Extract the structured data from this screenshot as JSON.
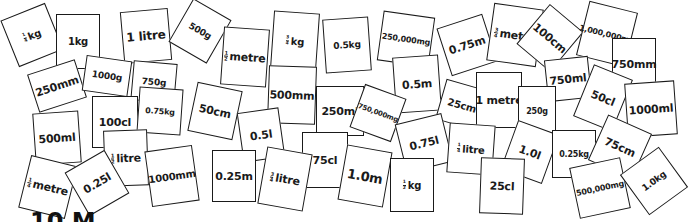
{
  "colors": {
    "card_border": "#1a1a1a",
    "card_fill": "#ffffff",
    "text": "#1a1a1a",
    "background": "#ffffff"
  },
  "cards": [
    {
      "label": "kg",
      "frac": [
        "1",
        "4"
      ],
      "x": 8,
      "y": 10,
      "w": 48,
      "h": 50,
      "rot": -22,
      "fs": 10
    },
    {
      "label": "1kg",
      "frac": null,
      "x": 56,
      "y": 14,
      "w": 44,
      "h": 55,
      "rot": 0,
      "fs": 10
    },
    {
      "label": "1 litre",
      "frac": null,
      "x": 122,
      "y": 10,
      "w": 48,
      "h": 52,
      "rot": -5,
      "fs": 12
    },
    {
      "label": "250mm",
      "frac": null,
      "x": 32,
      "y": 66,
      "w": 50,
      "h": 40,
      "rot": -18,
      "fs": 11
    },
    {
      "label": "1000g",
      "frac": null,
      "x": 84,
      "y": 58,
      "w": 46,
      "h": 36,
      "rot": 8,
      "fs": 9
    },
    {
      "label": "500g",
      "frac": null,
      "x": 178,
      "y": 6,
      "w": 44,
      "h": 50,
      "rot": 30,
      "fs": 9
    },
    {
      "label": "750g",
      "frac": null,
      "x": 132,
      "y": 62,
      "w": 44,
      "h": 40,
      "rot": 5,
      "fs": 9
    },
    {
      "label": "metre",
      "frac": [
        "1",
        "2"
      ],
      "x": 222,
      "y": 28,
      "w": 46,
      "h": 58,
      "rot": 4,
      "fs": 11
    },
    {
      "label": "kg",
      "frac": [
        "3",
        "4"
      ],
      "x": 272,
      "y": 12,
      "w": 46,
      "h": 58,
      "rot": 4,
      "fs": 10
    },
    {
      "label": "500mm",
      "frac": null,
      "x": 268,
      "y": 66,
      "w": 48,
      "h": 58,
      "rot": 2,
      "fs": 11
    },
    {
      "label": "0.5kg",
      "frac": null,
      "x": 324,
      "y": 18,
      "w": 46,
      "h": 54,
      "rot": -4,
      "fs": 9
    },
    {
      "label": "250,000mg",
      "frac": null,
      "x": 380,
      "y": 14,
      "w": 52,
      "h": 50,
      "rot": 8,
      "fs": 8
    },
    {
      "label": "0.5m",
      "frac": null,
      "x": 394,
      "y": 56,
      "w": 46,
      "h": 56,
      "rot": -4,
      "fs": 11
    },
    {
      "label": "0.75m",
      "frac": null,
      "x": 443,
      "y": 20,
      "w": 48,
      "h": 50,
      "rot": -18,
      "fs": 11
    },
    {
      "label": "metre",
      "frac": [
        "3",
        "4"
      ],
      "x": 490,
      "y": 6,
      "w": 50,
      "h": 58,
      "rot": 8,
      "fs": 11
    },
    {
      "label": "100cm",
      "frac": null,
      "x": 528,
      "y": 12,
      "w": 44,
      "h": 52,
      "rot": 40,
      "fs": 11
    },
    {
      "label": "1,000,000mg",
      "frac": null,
      "x": 582,
      "y": 6,
      "w": 50,
      "h": 56,
      "rot": 14,
      "fs": 8
    },
    {
      "label": "750mm",
      "frac": null,
      "x": 612,
      "y": 38,
      "w": 44,
      "h": 52,
      "rot": 0,
      "fs": 11
    },
    {
      "label": "750ml",
      "frac": null,
      "x": 546,
      "y": 58,
      "w": 44,
      "h": 42,
      "rot": -6,
      "fs": 11
    },
    {
      "label": "25cm",
      "frac": null,
      "x": 440,
      "y": 84,
      "w": 44,
      "h": 42,
      "rot": 16,
      "fs": 10
    },
    {
      "label": "1 metre",
      "frac": null,
      "x": 476,
      "y": 72,
      "w": 46,
      "h": 56,
      "rot": 0,
      "fs": 11
    },
    {
      "label": "250g",
      "frac": null,
      "x": 518,
      "y": 86,
      "w": 38,
      "h": 50,
      "rot": 0,
      "fs": 8
    },
    {
      "label": "50cl",
      "frac": null,
      "x": 582,
      "y": 70,
      "w": 42,
      "h": 56,
      "rot": 22,
      "fs": 11
    },
    {
      "label": "1000ml",
      "frac": null,
      "x": 626,
      "y": 82,
      "w": 50,
      "h": 54,
      "rot": -4,
      "fs": 11
    },
    {
      "label": "250ml",
      "frac": null,
      "x": 316,
      "y": 86,
      "w": 48,
      "h": 50,
      "rot": 0,
      "fs": 11
    },
    {
      "label": "750,000mg",
      "frac": null,
      "x": 356,
      "y": 90,
      "w": 44,
      "h": 46,
      "rot": 20,
      "fs": 7
    },
    {
      "label": "100cl",
      "frac": null,
      "x": 92,
      "y": 96,
      "w": 46,
      "h": 52,
      "rot": 0,
      "fs": 11
    },
    {
      "label": "0.75kg",
      "frac": null,
      "x": 138,
      "y": 88,
      "w": 44,
      "h": 46,
      "rot": 4,
      "fs": 8
    },
    {
      "label": "50cm",
      "frac": null,
      "x": 192,
      "y": 86,
      "w": 46,
      "h": 50,
      "rot": 12,
      "fs": 11
    },
    {
      "label": "0.5l",
      "frac": null,
      "x": 240,
      "y": 110,
      "w": 42,
      "h": 50,
      "rot": -8,
      "fs": 11
    },
    {
      "label": "500ml",
      "frac": null,
      "x": 34,
      "y": 112,
      "w": 46,
      "h": 52,
      "rot": -4,
      "fs": 11
    },
    {
      "label": "litre",
      "frac": [
        "1",
        "2"
      ],
      "x": 104,
      "y": 130,
      "w": 44,
      "h": 56,
      "rot": -2,
      "fs": 11
    },
    {
      "label": "75cl",
      "frac": null,
      "x": 302,
      "y": 132,
      "w": 46,
      "h": 56,
      "rot": 0,
      "fs": 11
    },
    {
      "label": "0.75l",
      "frac": null,
      "x": 400,
      "y": 118,
      "w": 48,
      "h": 50,
      "rot": -14,
      "fs": 11
    },
    {
      "label": "litre",
      "frac": [
        "1",
        "4"
      ],
      "x": 448,
      "y": 124,
      "w": 46,
      "h": 50,
      "rot": 4,
      "fs": 10
    },
    {
      "label": "1.0l",
      "frac": null,
      "x": 508,
      "y": 126,
      "w": 44,
      "h": 52,
      "rot": 20,
      "fs": 11
    },
    {
      "label": "0.25kg",
      "frac": null,
      "x": 552,
      "y": 130,
      "w": 44,
      "h": 48,
      "rot": 0,
      "fs": 8
    },
    {
      "label": "75cm",
      "frac": null,
      "x": 596,
      "y": 122,
      "w": 48,
      "h": 50,
      "rot": 24,
      "fs": 11
    },
    {
      "label": "metre",
      "frac": [
        "1",
        "4"
      ],
      "x": 24,
      "y": 160,
      "w": 48,
      "h": 54,
      "rot": 14,
      "fs": 11
    },
    {
      "label": "0.25l",
      "frac": null,
      "x": 74,
      "y": 158,
      "w": 46,
      "h": 50,
      "rot": -30,
      "fs": 11
    },
    {
      "label": "1000mm",
      "frac": null,
      "x": 148,
      "y": 148,
      "w": 48,
      "h": 56,
      "rot": -8,
      "fs": 10
    },
    {
      "label": "0.25m",
      "frac": null,
      "x": 212,
      "y": 150,
      "w": 44,
      "h": 52,
      "rot": 0,
      "fs": 11
    },
    {
      "label": "litre",
      "frac": [
        "3",
        "4"
      ],
      "x": 262,
      "y": 150,
      "w": 46,
      "h": 58,
      "rot": 10,
      "fs": 11
    },
    {
      "label": "1.0m",
      "frac": null,
      "x": 342,
      "y": 148,
      "w": 46,
      "h": 56,
      "rot": 10,
      "fs": 13
    },
    {
      "label": "kg",
      "frac": [
        "1",
        "2"
      ],
      "x": 390,
      "y": 158,
      "w": 44,
      "h": 54,
      "rot": 0,
      "fs": 10
    },
    {
      "label": "25cl",
      "frac": null,
      "x": 480,
      "y": 158,
      "w": 44,
      "h": 56,
      "rot": 2,
      "fs": 11
    },
    {
      "label": "500,000mg",
      "frac": null,
      "x": 574,
      "y": 162,
      "w": 52,
      "h": 52,
      "rot": -12,
      "fs": 8
    },
    {
      "label": "1.0kg",
      "frac": null,
      "x": 630,
      "y": 156,
      "w": 48,
      "h": 50,
      "rot": -36,
      "fs": 9
    }
  ],
  "footer": {
    "title": "10 M"
  }
}
